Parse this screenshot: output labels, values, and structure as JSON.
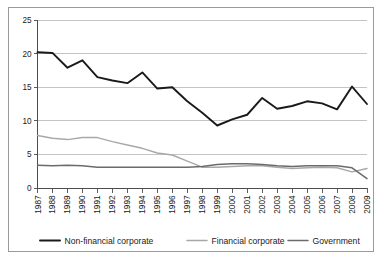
{
  "chart_data": {
    "type": "line",
    "title": "",
    "subtitle": "",
    "xlabel": "",
    "ylabel": "",
    "xlim": [
      1987,
      2009
    ],
    "ylim": [
      0,
      25
    ],
    "yticks": [
      0,
      5,
      10,
      15,
      20,
      25
    ],
    "grid": "horizontal",
    "legend_position": "bottom",
    "categories": [
      "1987",
      "1988",
      "1989",
      "1990",
      "1991",
      "1992",
      "1993",
      "1994",
      "1995",
      "1996",
      "1997",
      "1998",
      "1999",
      "2000",
      "2001",
      "2002",
      "2003",
      "2004",
      "2005",
      "2006",
      "2007",
      "2008",
      "2009"
    ],
    "series": [
      {
        "name": "Non-financial corporate",
        "color": "#1a1a1a",
        "width": 1.9,
        "values": [
          20.2,
          20.1,
          17.9,
          19.0,
          16.5,
          16.0,
          15.6,
          17.2,
          14.8,
          15.0,
          12.9,
          11.2,
          9.3,
          10.2,
          10.9,
          13.4,
          11.8,
          12.2,
          12.9,
          12.6,
          11.7,
          15.1,
          12.5
        ]
      },
      {
        "name": "Financial corporate",
        "color": "#a8a8a8",
        "width": 1.5,
        "values": [
          7.8,
          7.4,
          7.2,
          7.5,
          7.5,
          6.9,
          6.4,
          5.9,
          5.2,
          4.9,
          4.0,
          3.1,
          3.1,
          3.2,
          3.3,
          3.3,
          3.1,
          2.9,
          3.0,
          3.1,
          3.0,
          2.4,
          2.9
        ]
      },
      {
        "name": "Government",
        "color": "#6b6b6b",
        "width": 1.5,
        "values": [
          3.4,
          3.3,
          3.4,
          3.3,
          3.1,
          3.1,
          3.1,
          3.1,
          3.1,
          3.1,
          3.1,
          3.2,
          3.5,
          3.6,
          3.6,
          3.5,
          3.3,
          3.2,
          3.3,
          3.3,
          3.3,
          3.0,
          1.4
        ]
      }
    ]
  },
  "legend": {
    "items": [
      {
        "label": "Non-financial corporate",
        "color": "#1a1a1a"
      },
      {
        "label": "Financial corporate",
        "color": "#a8a8a8"
      },
      {
        "label": "Government",
        "color": "#6b6b6b"
      }
    ]
  }
}
